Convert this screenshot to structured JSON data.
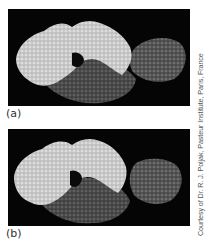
{
  "figure": {
    "panels": [
      {
        "id": "a",
        "label": "(a)",
        "description": "space-filling molecular model: light-gray antibody chains, dark-gray chain, and bound medium-gray antigen in contact"
      },
      {
        "id": "b",
        "label": "(b)",
        "description": "same model with antigen separated from antibody combining site"
      }
    ],
    "credit": "Courtesy of Dr. R. J. Poljak, Pasteur Institute, Paris, France",
    "colors": {
      "background": "#050505",
      "light_chain": "#c8c8c8",
      "dark_chain": "#555555",
      "antigen": "#6a6a6a",
      "label_text": "#333333",
      "credit_text": "#555555"
    }
  }
}
